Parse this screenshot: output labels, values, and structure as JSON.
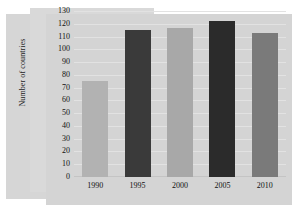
{
  "chart_data": {
    "type": "bar",
    "title": "",
    "subtitle": "",
    "xlabel": "",
    "ylabel": "Number of countries",
    "categories": [
      "1990",
      "1995",
      "2000",
      "2005",
      "2010"
    ],
    "values": [
      75,
      115,
      117,
      122,
      113
    ],
    "bar_colors": [
      "#b2b2b2",
      "#3a3a3a",
      "#a8a8a8",
      "#2b2b2b",
      "#7a7a7a"
    ],
    "ylim": [
      0,
      130
    ],
    "ytick_step": 10,
    "ytick_labels": [
      "0",
      "10",
      "20",
      "30",
      "40",
      "50",
      "60",
      "70",
      "80",
      "90",
      "100",
      "110",
      "120",
      "130"
    ],
    "grid": true,
    "grid_axis": "y",
    "legend": null,
    "legend_position": "none",
    "annotations": []
  },
  "theme": {
    "page_background": "#ffffff",
    "panel_back": "#d6d6d6",
    "panel_mid": "#d9d9d9",
    "panel_plot": "#d4d4d4",
    "gridline_color": "#e2e2e2",
    "baseline_color": "#c4c4c4",
    "tick_text_color": "#111111",
    "axis_title_color": "#1c1c1c"
  }
}
